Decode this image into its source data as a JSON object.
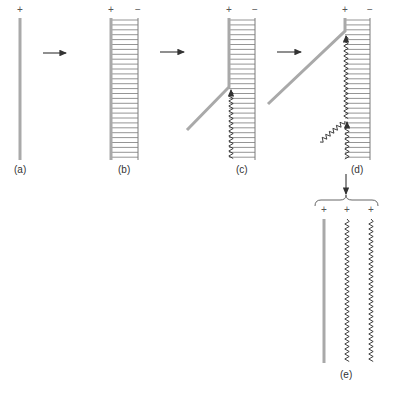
{
  "figure": {
    "panels": [
      {
        "id": "a",
        "label": "(a)",
        "signs": [
          "+"
        ]
      },
      {
        "id": "b",
        "label": "(b)",
        "signs": [
          "+",
          "−"
        ]
      },
      {
        "id": "c",
        "label": "(c)",
        "signs": [
          "+",
          "−"
        ]
      },
      {
        "id": "d",
        "label": "(d)",
        "signs": [
          "+",
          "−"
        ]
      },
      {
        "id": "e",
        "label": "(e)",
        "signs": [
          "+",
          "+",
          "+"
        ]
      }
    ],
    "colors": {
      "rod": "#a9a9a9",
      "rung": "#7a7a7a",
      "zigzag": "#2a2a2a",
      "arrow": "#333333"
    },
    "transitions": [
      "a-to-b",
      "b-to-c",
      "c-to-d",
      "d-to-e"
    ]
  }
}
